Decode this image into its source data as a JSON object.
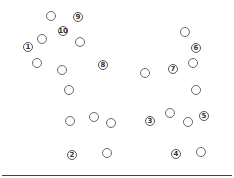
{
  "board": {
    "line": {
      "y": 175,
      "color": "#444444"
    },
    "circles": [
      {
        "x": 51,
        "y": 16,
        "label": ""
      },
      {
        "x": 78,
        "y": 17,
        "label": "9"
      },
      {
        "x": 63,
        "y": 31,
        "label": "10"
      },
      {
        "x": 42,
        "y": 39,
        "label": ""
      },
      {
        "x": 80,
        "y": 42,
        "label": ""
      },
      {
        "x": 28,
        "y": 47,
        "label": "1"
      },
      {
        "x": 37,
        "y": 63,
        "label": ""
      },
      {
        "x": 62,
        "y": 70,
        "label": ""
      },
      {
        "x": 103,
        "y": 65,
        "label": "8"
      },
      {
        "x": 185,
        "y": 32,
        "label": ""
      },
      {
        "x": 196,
        "y": 48,
        "label": "6"
      },
      {
        "x": 193,
        "y": 63,
        "label": ""
      },
      {
        "x": 173,
        "y": 69,
        "label": "7"
      },
      {
        "x": 145,
        "y": 73,
        "label": ""
      },
      {
        "x": 69,
        "y": 90,
        "label": ""
      },
      {
        "x": 196,
        "y": 90,
        "label": ""
      },
      {
        "x": 70,
        "y": 121,
        "label": ""
      },
      {
        "x": 94,
        "y": 117,
        "label": ""
      },
      {
        "x": 111,
        "y": 123,
        "label": ""
      },
      {
        "x": 150,
        "y": 121,
        "label": "3"
      },
      {
        "x": 170,
        "y": 113,
        "label": ""
      },
      {
        "x": 188,
        "y": 122,
        "label": ""
      },
      {
        "x": 204,
        "y": 116,
        "label": "5"
      },
      {
        "x": 72,
        "y": 155,
        "label": "2"
      },
      {
        "x": 107,
        "y": 153,
        "label": ""
      },
      {
        "x": 176,
        "y": 154,
        "label": "4"
      },
      {
        "x": 201,
        "y": 152,
        "label": ""
      }
    ]
  }
}
